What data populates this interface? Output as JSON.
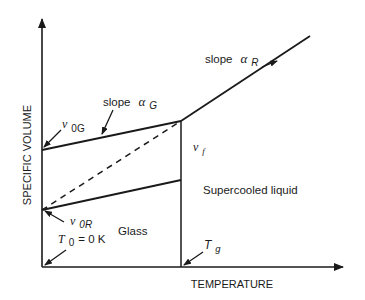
{
  "diagram": {
    "type": "specific-volume-vs-temperature glass transition diagram",
    "axes": {
      "x_label": "TEMPERATURE",
      "y_label": "SPECIFIC VOLUME"
    },
    "labels": {
      "slope_g_word": "slope",
      "slope_g_symbol": "α",
      "slope_g_sub": "G",
      "slope_r_word": "slope",
      "slope_r_symbol": "α",
      "slope_r_sub": "R",
      "v0g_symbol": "v",
      "v0g_sub": "0G",
      "v0r_symbol": "v",
      "v0r_sub": "0R",
      "vf_symbol": "v",
      "vf_sub": "f",
      "t0_symbol": "T",
      "t0_sub": "0",
      "t0_value": " = 0 K",
      "tg_symbol": "T",
      "tg_sub": "g",
      "region_glass": "Glass",
      "region_supercooled": "Supercooled liquid"
    },
    "colors": {
      "stroke": "#1a1a1a",
      "background": "#ffffff"
    }
  }
}
